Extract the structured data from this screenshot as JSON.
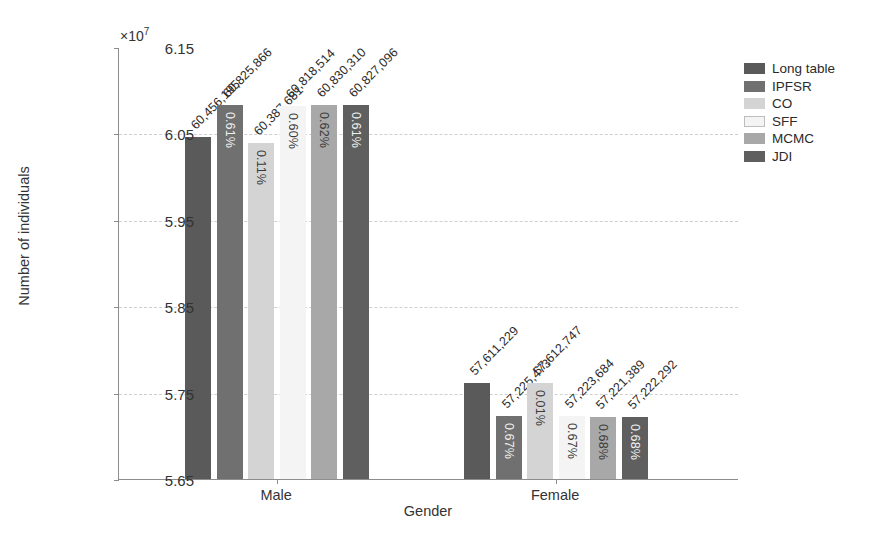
{
  "chart_data": {
    "type": "bar",
    "title": "",
    "xlabel": "Gender",
    "ylabel": "Number of individuals",
    "y_exponent_label": "×10",
    "y_exponent_power": "7",
    "y_scale": 10000000,
    "ylim": [
      56500000,
      61500000
    ],
    "ytick_labels": [
      "6.15",
      "6.05",
      "5.95",
      "5.85",
      "5.75",
      "5.65"
    ],
    "ytick_values": [
      61500000,
      60500000,
      59500000,
      58500000,
      57500000,
      56500000
    ],
    "grid": true,
    "grid_axis": "y",
    "legend_position": "upper right",
    "categories": [
      "Male",
      "Female"
    ],
    "series": [
      {
        "name": "Long table",
        "color": "#5a5a5a",
        "values": [
          60456195,
          57611229
        ],
        "value_labels": [
          "60,456,195",
          "57,611,229"
        ],
        "pct_labels": [
          "",
          ""
        ]
      },
      {
        "name": "IPFSR",
        "color": "#707070",
        "values": [
          60825866,
          57225473
        ],
        "value_labels": [
          "60,825,866",
          "57,225,473"
        ],
        "pct_labels": [
          "0.61%",
          "0.67%"
        ]
      },
      {
        "name": "CO",
        "color": "#d4d4d4",
        "values": [
          60387681,
          57612747
        ],
        "value_labels": [
          "60,387,681",
          "57,612,747"
        ],
        "pct_labels": [
          "0.11%",
          "0.01%"
        ]
      },
      {
        "name": "SFF",
        "color": "#f4f4f4",
        "values": [
          60818514,
          57223684
        ],
        "value_labels": [
          "60,818,514",
          "57,223,684"
        ],
        "pct_labels": [
          "0.60%",
          "0.67%"
        ]
      },
      {
        "name": "MCMC",
        "color": "#a8a8a8",
        "values": [
          60830310,
          57221389
        ],
        "value_labels": [
          "60,830,310",
          "57,221,389"
        ],
        "pct_labels": [
          "0.62%",
          "0.68%"
        ]
      },
      {
        "name": "JDI",
        "color": "#5f5f5f",
        "values": [
          60827096,
          57222292
        ],
        "value_labels": [
          "60,827,096",
          "57,222,292"
        ],
        "pct_labels": [
          "0.61%",
          "0.68%"
        ]
      }
    ]
  }
}
